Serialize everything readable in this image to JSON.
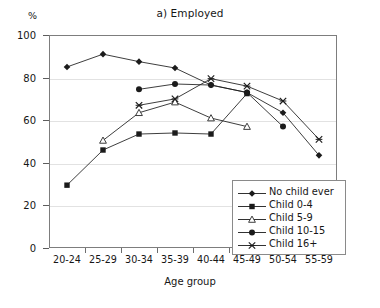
{
  "chart_data": {
    "type": "line",
    "title": "a) Employed",
    "xlabel": "Age group",
    "ylabel": "%",
    "ylim": [
      0,
      100
    ],
    "yticks": [
      0,
      20,
      40,
      60,
      80,
      100
    ],
    "grid": true,
    "legend_position": "inside-bottom-right",
    "categories": [
      "20-24",
      "25-29",
      "30-34",
      "35-39",
      "40-44",
      "45-49",
      "50-54",
      "55-59"
    ],
    "series": [
      {
        "name": "No child ever",
        "marker": "filled-diamond",
        "values": [
          85,
          91,
          87.5,
          84.5,
          76.5,
          73,
          63.5,
          43.5
        ]
      },
      {
        "name": "Child 0-4",
        "marker": "filled-square",
        "values": [
          29.5,
          46,
          53.5,
          54,
          53.5,
          72.5,
          null,
          null
        ]
      },
      {
        "name": "Child 5-9",
        "marker": "open-triangle",
        "values": [
          null,
          50.5,
          63.5,
          68.5,
          61,
          57,
          null,
          null
        ]
      },
      {
        "name": "Child 10-15",
        "marker": "filled-circle",
        "values": [
          null,
          null,
          74.5,
          77,
          76.5,
          73,
          57,
          null
        ]
      },
      {
        "name": "Child 16+",
        "marker": "x-cross",
        "values": [
          null,
          null,
          67,
          70,
          79.5,
          76,
          69,
          51
        ]
      }
    ],
    "colors": {
      "line": "#1b1b1b",
      "marker": "#1b1b1b",
      "grid": "#e2e2e2",
      "frame": "#7d7d7d",
      "background": "#ffffff"
    }
  }
}
